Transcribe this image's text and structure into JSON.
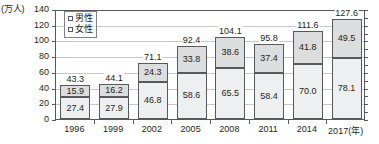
{
  "chart_data": {
    "type": "bar",
    "subtype": "stacked-vertical",
    "title": "",
    "xlabel": "(年)",
    "ylabel": "(万人)",
    "ylim": [
      0,
      140
    ],
    "ytick_step": 20,
    "yticks": [
      "0",
      "20",
      "40",
      "60",
      "80",
      "100",
      "120",
      "140"
    ],
    "grid": true,
    "grid_orientation": "horizontal",
    "legend_position": "top-left-inside",
    "categories": [
      "1996",
      "1999",
      "2002",
      "2005",
      "2008",
      "2011",
      "2014",
      "2017(年)"
    ],
    "series": [
      {
        "name": "男性",
        "key": "male",
        "color": "#dcdddf",
        "values": [
          15.9,
          16.2,
          24.3,
          33.8,
          38.6,
          37.4,
          41.8,
          49.5
        ]
      },
      {
        "name": "女性",
        "key": "female",
        "color": "#eeeff0",
        "values": [
          27.4,
          27.9,
          46.8,
          58.6,
          65.5,
          58.4,
          70.0,
          78.1
        ]
      }
    ],
    "totals": [
      43.3,
      44.1,
      71.1,
      92.4,
      104.1,
      95.8,
      111.6,
      127.6
    ],
    "data_labels": {
      "male": [
        "15.9",
        "16.2",
        "24.3",
        "33.8",
        "38.6",
        "37.4",
        "41.8",
        "49.5"
      ],
      "female": [
        "27.4",
        "27.9",
        "46.8",
        "58.6",
        "65.5",
        "58.4",
        "70.0",
        "78.1"
      ],
      "totals": [
        "43.3",
        "44.1",
        "71.1",
        "92.4",
        "104.1",
        "95.8",
        "111.6",
        "127.6"
      ]
    }
  },
  "axis": {
    "unit_label": "(万人)",
    "year_unit": "(年)"
  },
  "legend": {
    "items": [
      {
        "label": "男性",
        "swatch": "male-swatch-icon"
      },
      {
        "label": "女性",
        "swatch": "female-swatch-icon"
      }
    ]
  },
  "colors": {
    "male_fill": "#dcdddf",
    "female_fill": "#eeeff0",
    "bar_border": "#58595b",
    "grid": "#c7c8ca",
    "axis": "#58595b",
    "text": "#231f20",
    "background": "#ffffff"
  }
}
